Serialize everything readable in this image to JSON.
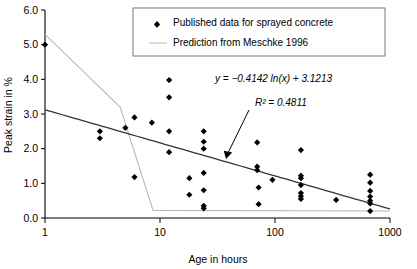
{
  "chart_data": {
    "type": "scatter",
    "title": "",
    "xlabel": "Age in hours",
    "ylabel": "Peak strain in %",
    "xscale": "log",
    "xlim": [
      1,
      1000
    ],
    "ylim": [
      0.0,
      6.0
    ],
    "yticks": [
      "0.0",
      "1.0",
      "2.0",
      "3.0",
      "4.0",
      "5.0",
      "6.0"
    ],
    "ytick_values": [
      0.0,
      1.0,
      2.0,
      3.0,
      4.0,
      5.0,
      6.0
    ],
    "xticks": [
      "1",
      "10",
      "100",
      "1000"
    ],
    "xtick_values": [
      1,
      10,
      100,
      1000
    ],
    "grid": false,
    "legend_position": "top-center",
    "legend": [
      {
        "label": "Published data for sprayed concrete",
        "marker": "diamond",
        "color": "#000000"
      },
      {
        "label": "Prediction from Meschke 1996",
        "marker": "line",
        "color": "#b8b8b8"
      }
    ],
    "annotations": [
      {
        "name": "regression-equation",
        "text": "y = −0.4142 ln(x) + 3.1213"
      },
      {
        "name": "r-squared",
        "text": "R² = 0.4811"
      }
    ],
    "series": [
      {
        "name": "Published data for sprayed concrete",
        "marker": "diamond",
        "points": [
          [
            1,
            5.0
          ],
          [
            3,
            2.5
          ],
          [
            3,
            2.3
          ],
          [
            5,
            2.6
          ],
          [
            6,
            2.9
          ],
          [
            6,
            1.18
          ],
          [
            8.5,
            2.75
          ],
          [
            12,
            3.98
          ],
          [
            12,
            3.48
          ],
          [
            12,
            2.5
          ],
          [
            12,
            1.9
          ],
          [
            18,
            1.15
          ],
          [
            18,
            0.67
          ],
          [
            24,
            2.5
          ],
          [
            24,
            2.2
          ],
          [
            24,
            2.0
          ],
          [
            24,
            1.3
          ],
          [
            24,
            0.8
          ],
          [
            24,
            0.35
          ],
          [
            24,
            0.28
          ],
          [
            70,
            2.18
          ],
          [
            70,
            1.48
          ],
          [
            70,
            1.38
          ],
          [
            72,
            0.88
          ],
          [
            72,
            0.4
          ],
          [
            95,
            1.1
          ],
          [
            168,
            1.96
          ],
          [
            168,
            1.22
          ],
          [
            168,
            1.15
          ],
          [
            168,
            0.95
          ],
          [
            168,
            0.72
          ],
          [
            168,
            0.63
          ],
          [
            168,
            0.55
          ],
          [
            340,
            0.52
          ],
          [
            672,
            1.25
          ],
          [
            672,
            1.02
          ],
          [
            672,
            0.78
          ],
          [
            672,
            0.62
          ],
          [
            672,
            0.5
          ],
          [
            672,
            0.42
          ],
          [
            672,
            0.2
          ]
        ]
      },
      {
        "name": "Trendline (logarithmic fit)",
        "type": "line",
        "equation": "y = -0.4142*ln(x) + 3.1213",
        "slope": -0.4142,
        "intercept": 3.1213,
        "r_squared": 0.4811,
        "color": "#333333"
      },
      {
        "name": "Prediction from Meschke 1996",
        "type": "line",
        "color": "#b8b8b8",
        "points": [
          [
            1,
            5.3
          ],
          [
            4.5,
            3.2
          ],
          [
            8.7,
            0.22
          ],
          [
            1000,
            0.2
          ]
        ]
      }
    ]
  },
  "axes": {
    "xlabel": "Age in hours",
    "ylabel": "Peak strain in %"
  }
}
